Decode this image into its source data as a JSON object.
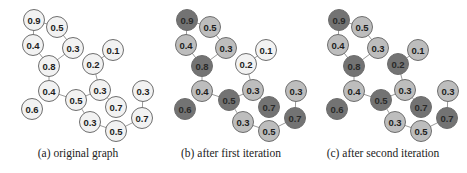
{
  "figure": {
    "shade_colors": {
      "white": "#f2f2f2",
      "light": "#bdbdbd",
      "dark": "#737373",
      "stroke": "#6e6e6e",
      "edge": "#9a9a9a",
      "text": "#1e1e1e"
    },
    "nodes": [
      {
        "id": "n09",
        "label": "0.9",
        "x": 34,
        "y": 20
      },
      {
        "id": "n05a",
        "label": "0.5",
        "x": 57,
        "y": 27
      },
      {
        "id": "n04a",
        "label": "0.4",
        "x": 33,
        "y": 45
      },
      {
        "id": "n03a",
        "label": "0.3",
        "x": 73,
        "y": 48
      },
      {
        "id": "n01",
        "label": "0.1",
        "x": 113,
        "y": 50
      },
      {
        "id": "n08",
        "label": "0.8",
        "x": 49,
        "y": 66
      },
      {
        "id": "n02",
        "label": "0.2",
        "x": 93,
        "y": 64
      },
      {
        "id": "n04b",
        "label": "0.4",
        "x": 49,
        "y": 91
      },
      {
        "id": "n03b",
        "label": "0.3",
        "x": 100,
        "y": 90
      },
      {
        "id": "n05b",
        "label": "0.5",
        "x": 76,
        "y": 100
      },
      {
        "id": "n03c",
        "label": "0.3",
        "x": 143,
        "y": 91
      },
      {
        "id": "n06",
        "label": "0.6",
        "x": 32,
        "y": 109
      },
      {
        "id": "n07a",
        "label": "0.7",
        "x": 116,
        "y": 107
      },
      {
        "id": "n07b",
        "label": "0.7",
        "x": 142,
        "y": 118
      },
      {
        "id": "n03d",
        "label": "0.3",
        "x": 90,
        "y": 122
      },
      {
        "id": "n05c",
        "label": "0.5",
        "x": 116,
        "y": 131
      }
    ],
    "edges": [
      [
        "n09",
        "n05a"
      ],
      [
        "n09",
        "n04a"
      ],
      [
        "n05a",
        "n03a"
      ],
      [
        "n04a",
        "n08"
      ],
      [
        "n03a",
        "n08"
      ],
      [
        "n08",
        "n04b"
      ],
      [
        "n04b",
        "n05b"
      ],
      [
        "n05b",
        "n03b"
      ],
      [
        "n03b",
        "n02"
      ],
      [
        "n02",
        "n01"
      ],
      [
        "n05b",
        "n03d"
      ],
      [
        "n03d",
        "n05c"
      ],
      [
        "n05c",
        "n07b"
      ],
      [
        "n07b",
        "n03c"
      ],
      [
        "n03b",
        "n07a"
      ]
    ],
    "panels": [
      {
        "caption": "(a) original graph",
        "offset_x": 0,
        "shades": {
          "n09": "white",
          "n05a": "white",
          "n04a": "white",
          "n03a": "white",
          "n01": "white",
          "n08": "white",
          "n02": "white",
          "n04b": "white",
          "n03b": "white",
          "n05b": "white",
          "n03c": "white",
          "n06": "white",
          "n07a": "white",
          "n07b": "white",
          "n03d": "white",
          "n05c": "white"
        }
      },
      {
        "caption": "(b) after first iteration",
        "offset_x": 153,
        "shades": {
          "n09": "dark",
          "n05a": "light",
          "n04a": "light",
          "n03a": "light",
          "n01": "white",
          "n08": "dark",
          "n02": "white",
          "n04b": "light",
          "n03b": "light",
          "n05b": "dark",
          "n03c": "light",
          "n06": "dark",
          "n07a": "dark",
          "n07b": "dark",
          "n03d": "light",
          "n05c": "light"
        }
      },
      {
        "caption": "(c) after second iteration",
        "offset_x": 305,
        "shades": {
          "n09": "dark",
          "n05a": "light",
          "n04a": "light",
          "n03a": "light",
          "n01": "light",
          "n08": "dark",
          "n02": "dark",
          "n04b": "light",
          "n03b": "light",
          "n05b": "dark",
          "n03c": "light",
          "n06": "dark",
          "n07a": "dark",
          "n07b": "dark",
          "n03d": "light",
          "n05c": "light"
        }
      }
    ]
  }
}
